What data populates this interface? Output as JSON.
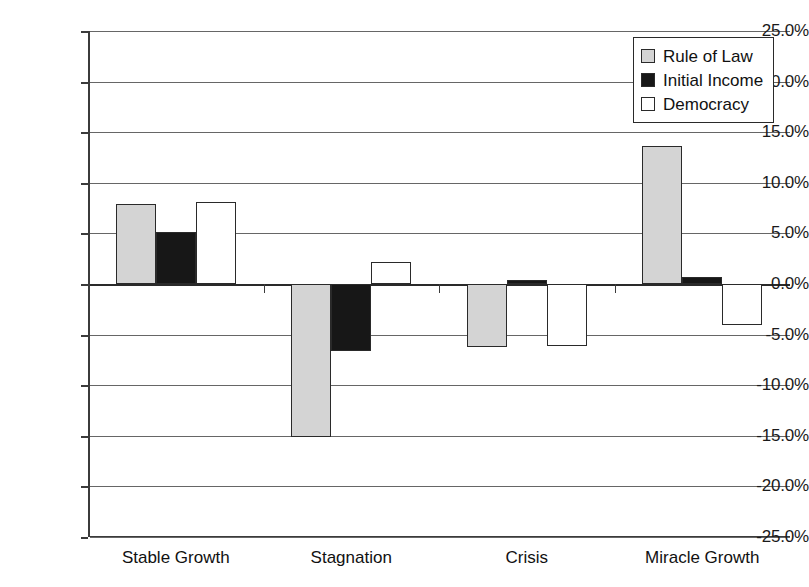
{
  "chart_data": {
    "type": "bar",
    "title": "",
    "subtitle": "",
    "xlabel": "",
    "ylabel": "",
    "categories": [
      "Stable Growth",
      "Stagnation",
      "Crisis",
      "Miracle Growth"
    ],
    "series": [
      {
        "name": "Rule of Law",
        "color": "#d4d4d4",
        "values": [
          7.9,
          -15.1,
          -6.2,
          13.6
        ]
      },
      {
        "name": "Initial Income",
        "color": "#171717",
        "values": [
          5.1,
          -6.6,
          0.4,
          0.7
        ]
      },
      {
        "name": "Democracy",
        "color": "#ffffff",
        "values": [
          8.1,
          2.2,
          -6.1,
          -4.1
        ]
      }
    ],
    "ylim": [
      -25.0,
      25.0
    ],
    "ytick_values": [
      25.0,
      20.0,
      15.0,
      10.0,
      5.0,
      0.0,
      -5.0,
      -10.0,
      -15.0,
      -20.0,
      -25.0
    ],
    "ytick_labels": [
      "25.0%",
      "20.0%",
      "15.0%",
      "10.0%",
      "5.0%",
      "0.0%",
      "-5.0%",
      "-10.0%",
      "-15.0%",
      "-20.0%",
      "-25.0%"
    ],
    "value_suffix": "%",
    "grid": true,
    "legend_position": "top-right",
    "legend_entries": [
      "Rule of Law",
      "Initial Income",
      "Democracy"
    ]
  }
}
